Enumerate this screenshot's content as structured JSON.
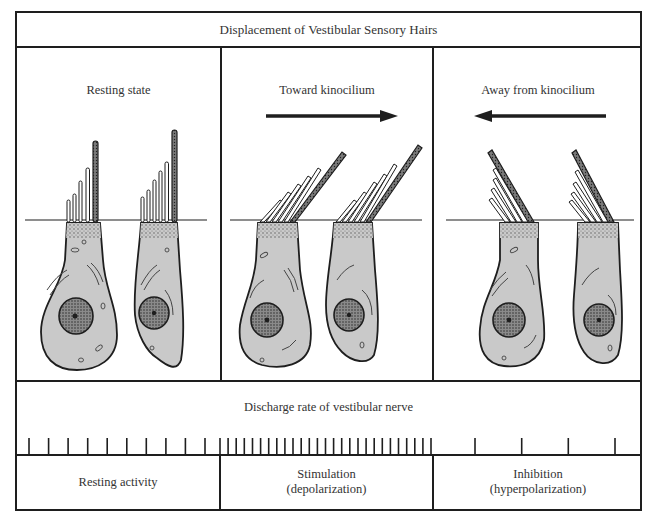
{
  "figure": {
    "title": "Displacement of Vestibular Sensory Hairs",
    "panels": [
      {
        "label": "Resting state",
        "arrow": "none",
        "hair_tilt": "upright"
      },
      {
        "label": "Toward kinocilium",
        "arrow": "right",
        "hair_tilt": "toward kinocilium"
      },
      {
        "label": "Away from kinocilium",
        "arrow": "left",
        "hair_tilt": "away from kinocilium"
      }
    ],
    "discharge": {
      "title": "Discharge rate of vestibular nerve",
      "spike_counts": [
        10,
        27,
        4
      ]
    },
    "responses": [
      {
        "line1": "Resting activity",
        "line2": ""
      },
      {
        "line1": "Stimulation",
        "line2": "(depolarization)"
      },
      {
        "line1": "Inhibition",
        "line2": "(hyperpolarization)"
      }
    ]
  },
  "colors": {
    "cell_fill": "#c9c9c9",
    "line": "#1e1e1e",
    "nucleus": "#6a6a6a",
    "background": "#ffffff"
  }
}
